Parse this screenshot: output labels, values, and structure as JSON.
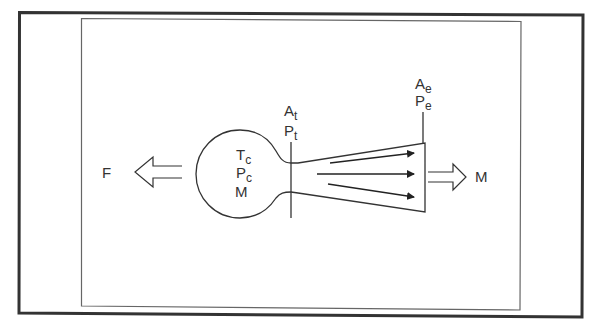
{
  "diagram": {
    "colors": {
      "background": "#ffffff",
      "outer_frame": "#333333",
      "inner_frame": "#666666",
      "stroke": "#333333",
      "text": "#333333"
    },
    "labels": {
      "thrust": "F",
      "chamber_temp": {
        "base": "T",
        "sub": "c"
      },
      "chamber_pressure": {
        "base": "P",
        "sub": "c"
      },
      "chamber_mass": "M",
      "throat_area": {
        "base": "A",
        "sub": "t"
      },
      "throat_pressure": {
        "base": "P",
        "sub": "t"
      },
      "exit_area": {
        "base": "A",
        "sub": "e"
      },
      "exit_pressure": {
        "base": "P",
        "sub": "e"
      },
      "exhaust_mass": "M"
    },
    "elements": [
      "outer-frame",
      "inner-frame",
      "thrust-arrow-left",
      "combustion-chamber",
      "throat-line",
      "nozzle",
      "flow-arrows",
      "exit-line",
      "exhaust-arrow-right"
    ]
  }
}
